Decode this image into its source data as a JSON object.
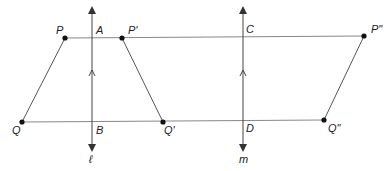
{
  "diagram": {
    "type": "geometry-reflection",
    "colors": {
      "line": "#777777",
      "point": "#111111",
      "text": "#222222"
    },
    "lines": [
      {
        "name": "l",
        "label": "ℓ",
        "x": 92,
        "y1": 8,
        "y2": 150
      },
      {
        "name": "m",
        "label": "m",
        "x": 243,
        "y1": 8,
        "y2": 150
      }
    ],
    "horizontals": [
      {
        "y1": 38,
        "y2": 36,
        "x1": 65,
        "x2": 364
      },
      {
        "y1": 122,
        "y2": 120,
        "x1": 22,
        "x2": 324
      }
    ],
    "points": [
      {
        "label": "P",
        "x": 65,
        "y": 38
      },
      {
        "label": "P'",
        "x": 122,
        "y": 38
      },
      {
        "label": "P\"",
        "x": 364,
        "y": 36
      },
      {
        "label": "Q",
        "x": 22,
        "y": 122
      },
      {
        "label": "Q'",
        "x": 163,
        "y": 122
      },
      {
        "label": "Q\"",
        "x": 324,
        "y": 120
      }
    ],
    "intersections": [
      {
        "label": "A"
      },
      {
        "label": "B"
      },
      {
        "label": "C"
      },
      {
        "label": "D"
      }
    ]
  }
}
